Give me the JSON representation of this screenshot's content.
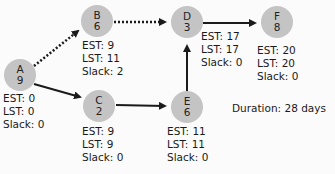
{
  "diagram": {
    "type": "critical-path-network",
    "node_color": "#c4c4c4",
    "edge_color": "#1a1a1a",
    "nodes": [
      {
        "id": "A",
        "duration": "9",
        "est": "EST: 0",
        "lst": "LST: 0",
        "slack": "Slack: 0"
      },
      {
        "id": "B",
        "duration": "6",
        "est": "EST: 9",
        "lst": "LST: 11",
        "slack": "Slack: 2"
      },
      {
        "id": "C",
        "duration": "2",
        "est": "EST: 9",
        "lst": "LST: 9",
        "slack": "Slack: 0"
      },
      {
        "id": "D",
        "duration": "3",
        "est": "EST: 17",
        "lst": "LST: 17",
        "slack": "Slack: 0"
      },
      {
        "id": "E",
        "duration": "6",
        "est": "EST: 11",
        "lst": "LST: 11",
        "slack": "Slack: 0"
      },
      {
        "id": "F",
        "duration": "8",
        "est": "EST: 20",
        "lst": "LST: 20",
        "slack": "Slack: 0"
      }
    ],
    "edges": [
      {
        "from": "A",
        "to": "B",
        "style": "dotted"
      },
      {
        "from": "A",
        "to": "C",
        "style": "solid"
      },
      {
        "from": "B",
        "to": "D",
        "style": "dotted"
      },
      {
        "from": "C",
        "to": "E",
        "style": "solid"
      },
      {
        "from": "E",
        "to": "D",
        "style": "solid"
      },
      {
        "from": "D",
        "to": "F",
        "style": "solid"
      }
    ],
    "duration_label": "Duration: 28 days"
  }
}
